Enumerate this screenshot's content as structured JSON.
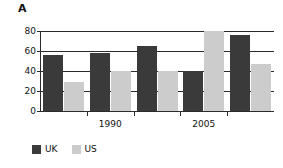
{
  "panel": {
    "label": "A"
  },
  "chart_data": {
    "type": "bar",
    "title": "",
    "xlabel": "",
    "ylabel": "",
    "ylim": [
      0,
      80
    ],
    "yticks": [
      0,
      20,
      40,
      60,
      80
    ],
    "ytick_labels": [
      "0",
      "20",
      "40",
      "60",
      "80"
    ],
    "grid": true,
    "legend_position": "bottom-left",
    "categories": [
      "",
      "1990",
      "",
      "2005",
      ""
    ],
    "xtick_labels": [
      "1990",
      "2005"
    ],
    "series": [
      {
        "name": "UK",
        "color": "#3a3a3a",
        "values": [
          56,
          58,
          65,
          40,
          76
        ]
      },
      {
        "name": "US",
        "color": "#cccccc",
        "values": [
          29,
          40,
          40,
          80,
          47
        ]
      }
    ]
  },
  "legend": {
    "items": [
      {
        "label": "UK",
        "color": "#3a3a3a"
      },
      {
        "label": "US",
        "color": "#cccccc"
      }
    ]
  }
}
